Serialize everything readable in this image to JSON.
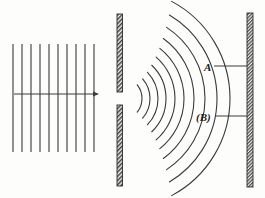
{
  "figure": {
    "width": 265,
    "height": 198,
    "background_color": "#fdfdfc",
    "ink_color": "#3a3a3a",
    "hatch_color": "#4a4a4a"
  },
  "labels": {
    "a": "A",
    "b": "(B)"
  },
  "incoming_waves": {
    "name": "plane-wavefronts",
    "count": 10,
    "x_positions": [
      13,
      22,
      31,
      40,
      49,
      58,
      67,
      76,
      85,
      94
    ],
    "y_top": 44,
    "y_bottom": 152,
    "stroke_width": 1.1
  },
  "direction_arrow": {
    "name": "propagation-arrow",
    "x_start": 14,
    "x_end": 99,
    "y": 94,
    "head_length": 6,
    "head_width": 5
  },
  "barrier": {
    "name": "slit-barrier",
    "x": 117,
    "width": 5.5,
    "y_top": 14,
    "y_bottom": 186,
    "slit_top": 92,
    "slit_bottom": 105
  },
  "screen": {
    "name": "detection-screen",
    "x": 247,
    "width": 6,
    "y_top": 13,
    "y_bottom": 187
  },
  "diffracted_waves": {
    "name": "circular-wavefronts",
    "origin_x": 120,
    "origin_y": 98.5,
    "radii": [
      22,
      30,
      38,
      46,
      55,
      64,
      74,
      85,
      97,
      110
    ],
    "angle_start_deg": -62,
    "angle_end_deg": 62,
    "stroke_width": 1.1
  },
  "leaders": {
    "a_leader": {
      "x1": 214,
      "x2": 247,
      "y": 66
    },
    "b_leader": {
      "x1": 215,
      "x2": 247,
      "y": 116
    }
  }
}
